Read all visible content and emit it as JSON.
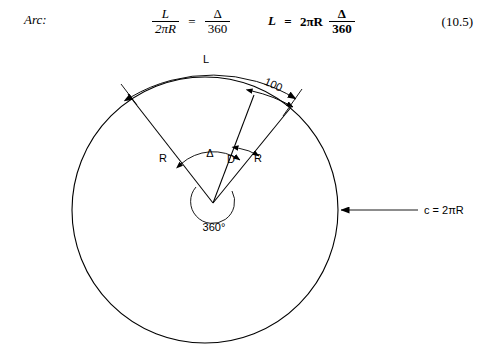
{
  "equation": {
    "tag": "Arc:",
    "eq1": {
      "left_numerator": "L",
      "left_denominator": "2πR",
      "equals": "=",
      "right_numerator": "Δ",
      "right_denominator": "360"
    },
    "eq2": {
      "lhs": "L",
      "equals": "=",
      "coefficient": "2πR",
      "numerator": "Δ",
      "denominator": "360"
    },
    "number": "(10.5)"
  },
  "diagram": {
    "arc_length_label": "L",
    "station_label": "100",
    "radius_label_left": "R",
    "radius_label_right": "R",
    "delta_label": "Δ",
    "degree_of_curve_label": "D",
    "full_circle_label": "360°",
    "circumference_label": "c = 2πR",
    "colors": {
      "stroke": "#000000",
      "background": "#ffffff"
    },
    "geometry": {
      "circle_center_x": 205,
      "circle_center_y": 166,
      "circle_radius": 133,
      "vertex_x": 213,
      "vertex_y": 159,
      "inner_circle_radius": 22
    }
  }
}
